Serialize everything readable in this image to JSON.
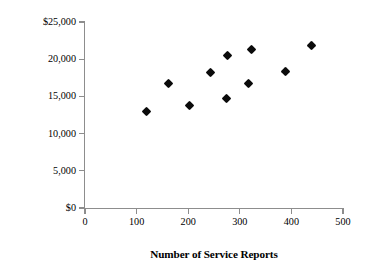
{
  "chart_data": {
    "type": "scatter",
    "title": "",
    "xlabel": "Number of Service Reports",
    "ylabel": "Customer-Service Department Costs",
    "xlim": [
      0,
      500
    ],
    "ylim": [
      0,
      25000
    ],
    "grid": false,
    "legend": null,
    "x_ticks": [
      0,
      100,
      200,
      300,
      400,
      500
    ],
    "x_tick_labels": [
      "0",
      "100",
      "200",
      "300",
      "400",
      "500"
    ],
    "y_ticks": [
      0,
      5000,
      10000,
      15000,
      20000,
      25000
    ],
    "y_tick_labels": [
      "$0",
      "5,000",
      "10,000",
      "15,000",
      "20,000",
      "$25,000"
    ],
    "marker": "filled-diamond",
    "marker_color": "#0b0b0b",
    "points": [
      {
        "x": 120,
        "y": 13000
      },
      {
        "x": 161,
        "y": 16800
      },
      {
        "x": 203,
        "y": 13800
      },
      {
        "x": 244,
        "y": 18200
      },
      {
        "x": 275,
        "y": 14700
      },
      {
        "x": 277,
        "y": 20500
      },
      {
        "x": 316,
        "y": 16700
      },
      {
        "x": 323,
        "y": 21300
      },
      {
        "x": 388,
        "y": 18400
      },
      {
        "x": 438,
        "y": 21900
      }
    ]
  },
  "axes": {
    "x_title": "Number of Service Reports",
    "y_title": "Customer-Service Department Costs"
  }
}
